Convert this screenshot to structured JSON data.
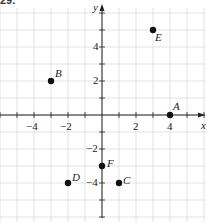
{
  "figure": {
    "corner_label": "29."
  },
  "chart_data": {
    "type": "scatter",
    "title": "",
    "xlabel": "x",
    "ylabel": "y",
    "xlim": [
      -6,
      6
    ],
    "ylim": [
      -6,
      6
    ],
    "grid": true,
    "x_ticks": [
      -4,
      -2,
      2,
      4
    ],
    "y_ticks": [
      -4,
      -2,
      2,
      4
    ],
    "points": [
      {
        "label": "A",
        "x": 4,
        "y": 0
      },
      {
        "label": "B",
        "x": -3,
        "y": 2
      },
      {
        "label": "C",
        "x": 1,
        "y": -4
      },
      {
        "label": "D",
        "x": -2,
        "y": -4
      },
      {
        "label": "E",
        "x": 3,
        "y": 5
      },
      {
        "label": "F",
        "x": 0,
        "y": -3
      }
    ]
  },
  "layout": {
    "origin_px": [
      102,
      115
    ],
    "unit_px": 17,
    "grid_color": "#dcdcdc",
    "axis_color": "#222222",
    "point_color": "#111111"
  }
}
